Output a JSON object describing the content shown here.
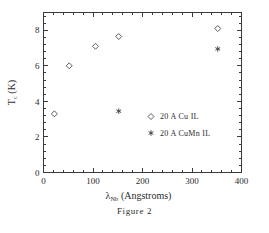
{
  "caption": "Figure 2",
  "chart_data": {
    "type": "scatter",
    "title": "",
    "xlabel": "λ_Nb  (Angstroms)",
    "xlabel_symbol": "λ",
    "xlabel_subscript": "Nb",
    "xlabel_units": "(Angstroms)",
    "ylabel": "T_c  (K)",
    "ylabel_symbol": "T",
    "ylabel_subscript": "c",
    "ylabel_units": "(K)",
    "xlim": [
      0,
      400
    ],
    "ylim": [
      0,
      9
    ],
    "xticks": [
      0,
      100,
      200,
      300,
      400
    ],
    "xtick_labels": [
      "0",
      "100",
      "200",
      "300",
      "400"
    ],
    "yticks": [
      0,
      2,
      4,
      6,
      8
    ],
    "ytick_labels": [
      "0",
      "2",
      "4",
      "6",
      "8"
    ],
    "x_minor_interval": 20,
    "y_minor_interval": 0.4,
    "grid": false,
    "legend_position": "center-right",
    "series": [
      {
        "name": "20 A Cu IL",
        "marker": "diamond",
        "color": "#4a4a4a",
        "points": [
          {
            "x": 22,
            "y": 3.3
          },
          {
            "x": 52,
            "y": 6.0
          },
          {
            "x": 105,
            "y": 7.1
          },
          {
            "x": 152,
            "y": 7.65
          },
          {
            "x": 352,
            "y": 8.1
          }
        ]
      },
      {
        "name": "20 A CuMn IL",
        "marker": "asterisk",
        "color": "#3a3a3a",
        "points": [
          {
            "x": 152,
            "y": 3.45
          },
          {
            "x": 352,
            "y": 6.95
          }
        ]
      }
    ]
  }
}
